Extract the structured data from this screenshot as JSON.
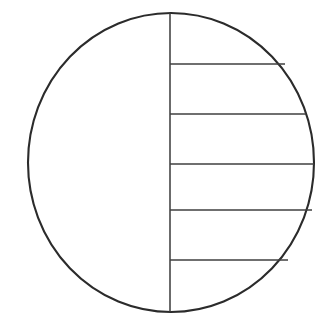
{
  "figure": {
    "background_color": "#ffffff",
    "width": 334,
    "height": 326
  },
  "chart_data": {
    "type": "diagram",
    "xlabel": "",
    "ylabel": "",
    "xlim": [
      0,
      334
    ],
    "ylim": [
      0,
      326
    ],
    "grid": false,
    "legend": "none",
    "shapes": [
      {
        "name": "circle-outline",
        "kind": "ellipse",
        "cx": 171,
        "cy": 162.5,
        "rx": 143,
        "ry": 149.5,
        "stroke": "#2b2b2b",
        "stroke_width": 2.1,
        "fill": "none"
      },
      {
        "name": "vertical-diameter",
        "kind": "line",
        "x1": 170,
        "y1": 13,
        "x2": 170,
        "y2": 312,
        "stroke": "#3a3a3a",
        "stroke_width": 1.5
      }
    ],
    "chords": [
      {
        "name": "chord-1",
        "index": 1,
        "y": 64,
        "x_start": 170,
        "x_end": 285,
        "stroke": "#3f3f3f",
        "stroke_width": 1.4
      },
      {
        "name": "chord-2",
        "index": 2,
        "y": 114,
        "x_start": 170,
        "x_end": 306,
        "stroke": "#3f3f3f",
        "stroke_width": 1.4
      },
      {
        "name": "chord-3",
        "index": 3,
        "y": 164,
        "x_start": 170,
        "x_end": 314,
        "stroke": "#3f3f3f",
        "stroke_width": 1.4
      },
      {
        "name": "chord-4",
        "index": 4,
        "y": 210,
        "x_start": 170,
        "x_end": 312,
        "stroke": "#3f3f3f",
        "stroke_width": 1.4
      },
      {
        "name": "chord-5",
        "index": 5,
        "y": 260,
        "x_start": 170,
        "x_end": 288,
        "stroke": "#3f3f3f",
        "stroke_width": 1.4
      }
    ],
    "counts": {
      "circles": 1,
      "diameters": 1,
      "chords": 5,
      "right_half_regions": 6,
      "left_half_regions": 1
    }
  }
}
